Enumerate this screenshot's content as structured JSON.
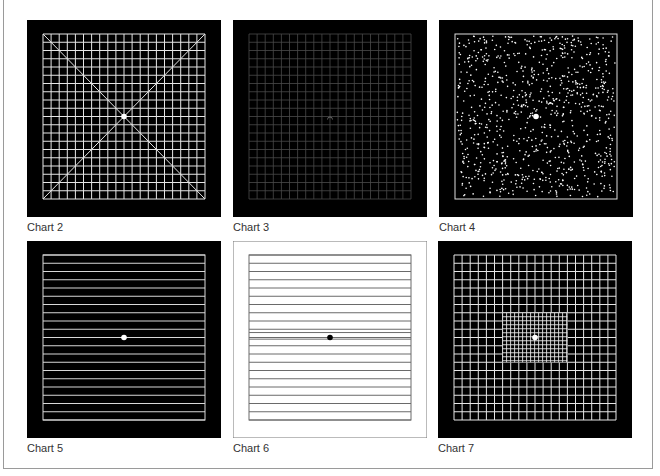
{
  "figure": {
    "panels": [
      {
        "id": "chart-2",
        "label": "Chart 2",
        "x": 27,
        "y": 20,
        "type": "grid-with-diagonals",
        "bg": "#000000",
        "line": "#e6e6e6",
        "cells": 20,
        "center_dot": "#ffffff"
      },
      {
        "id": "chart-3",
        "label": "Chart 3",
        "x": 233,
        "y": 20,
        "type": "dim-grid",
        "bg": "#000000",
        "line": "#4a4a4a",
        "cells": 20,
        "center_mark": "arc"
      },
      {
        "id": "chart-4",
        "label": "Chart 4",
        "x": 439,
        "y": 20,
        "type": "random-dots",
        "bg": "#000000",
        "line": "#dddddd",
        "dot_count": 900,
        "center_dot": "#ffffff"
      },
      {
        "id": "chart-5",
        "label": "Chart 5",
        "x": 27,
        "y": 241,
        "type": "horizontal-lines",
        "bg": "#000000",
        "line": "#d8d8d8",
        "cells": 20,
        "center_dot": "#ffffff"
      },
      {
        "id": "chart-6",
        "label": "Chart 6",
        "x": 233,
        "y": 241,
        "type": "horizontal-lines-inverted",
        "bg": "#ffffff",
        "line": "#6a6a6a",
        "cells": 20,
        "extra_lines": [
          0.47,
          0.51
        ],
        "center_dot": "#000000"
      },
      {
        "id": "chart-7",
        "label": "Chart 7",
        "x": 438,
        "y": 241,
        "type": "grid-with-fine-center",
        "bg": "#000000",
        "line": "#e6e6e6",
        "cells": 20,
        "fine_region": [
          0.3,
          0.35,
          0.7,
          0.65
        ],
        "fine_step": 4,
        "center_dot": "#ffffff"
      }
    ]
  }
}
